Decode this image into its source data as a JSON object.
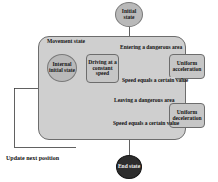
{
  "diagram": {
    "type": "state-machine",
    "colors": {
      "composite_fill": "#cfcfcf",
      "state_fill": "#c6c6c6",
      "state_stroke": "#6d6d6d",
      "initial_circle_fill": "#b9b9b9",
      "end_circle_fill": "#2d2d2d",
      "line": "#3a3a3a",
      "text": "#141414",
      "background": "#ffffff"
    },
    "region": {
      "label": "Movement state"
    },
    "nodes": {
      "initial_state": "Initial state",
      "internal_initial_state": "Internal initial state",
      "driving_constant_speed": "Driving at a constant speed",
      "uniform_acceleration": "Uniform acceleration",
      "uniform_deceleration": "Uniform deceleration",
      "end_state": "End state"
    },
    "transitions": {
      "entering_dangerous_area": "Entering a dangerous area",
      "speed_equals_value_upper": "Speed equals a certain value",
      "leaving_dangerous_area": "Leaving a dangerous area",
      "speed_equals_value_lower": "Speed equals a certain value",
      "update_next_position": "Update next position"
    }
  }
}
